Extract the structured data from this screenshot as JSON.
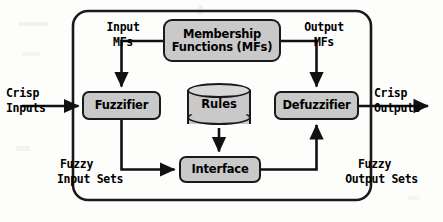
{
  "diagram": {
    "colors": {
      "node_fill": "#c9c9c9",
      "node_stroke": "#1a1a1a",
      "container_stroke": "#1a1a1a",
      "background": "#fdfdfc",
      "text": "#000000"
    },
    "container": {
      "name": "fuzzy-inference-system-boundary"
    },
    "nodes": {
      "membership_functions": {
        "line1": "Membership",
        "line2": "Functions (MFs)",
        "shape": "rounded-rect"
      },
      "fuzzifier": {
        "label": "Fuzzifier",
        "shape": "rounded-rect"
      },
      "rules": {
        "label": "Rules",
        "shape": "cylinder"
      },
      "defuzzifier": {
        "label": "Defuzzifier",
        "shape": "rounded-rect"
      },
      "interface": {
        "label": "Interface",
        "shape": "rounded-rect"
      }
    },
    "labels": {
      "input_mfs": {
        "line1": "Input",
        "line2": "MFs"
      },
      "output_mfs": {
        "line1": "Output",
        "line2": "MFs"
      },
      "crisp_inputs": {
        "line1": "Crisp",
        "line2": "Inputs"
      },
      "crisp_outputs": {
        "line1": "Crisp",
        "line2": "Outputs"
      },
      "fuzzy_input_sets": {
        "line1": "Fuzzy",
        "line2": "Input Sets"
      },
      "fuzzy_output_sets": {
        "line1": "Fuzzy",
        "line2": "Output Sets"
      }
    },
    "connections": [
      {
        "from": "crisp-inputs",
        "to": "fuzzifier",
        "label": "Crisp Inputs"
      },
      {
        "from": "membership-functions",
        "to": "fuzzifier",
        "label": "Input MFs"
      },
      {
        "from": "membership-functions",
        "to": "defuzzifier",
        "label": "Output MFs"
      },
      {
        "from": "fuzzifier",
        "to": "interface",
        "label": "Fuzzy Input Sets"
      },
      {
        "from": "rules",
        "to": "interface",
        "label": ""
      },
      {
        "from": "interface",
        "to": "defuzzifier",
        "label": "Fuzzy Output Sets"
      },
      {
        "from": "defuzzifier",
        "to": "crisp-outputs",
        "label": "Crisp Outputs"
      }
    ]
  }
}
